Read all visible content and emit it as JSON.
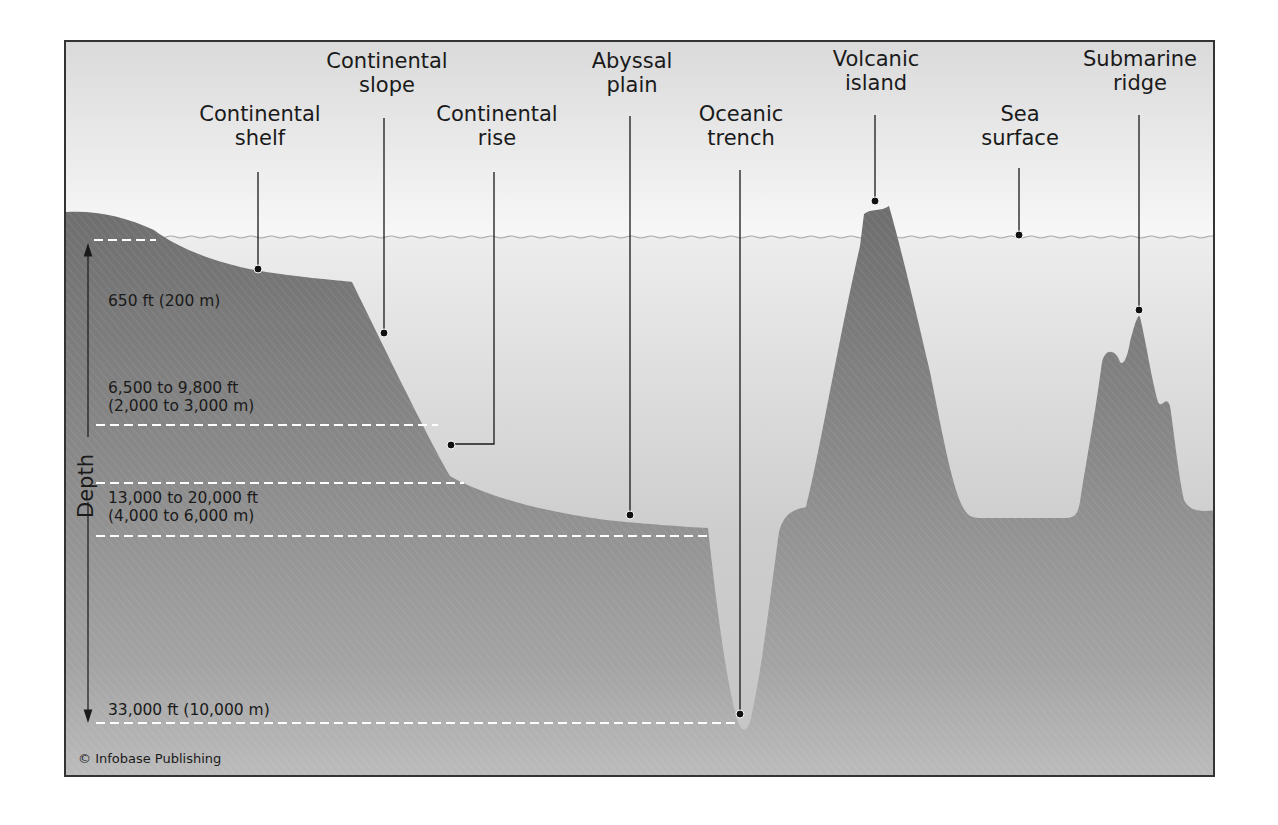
{
  "diagram": {
    "type": "ocean-floor-profile",
    "colors": {
      "sky_top": "#d9d9d9",
      "sky_bottom": "#f7f7f7",
      "water_top": "#ececec",
      "water_bottom": "#bcbcbc",
      "land": "#7a7a7a",
      "land_deep": "#999999",
      "frame": "#333333",
      "leader": "#1a1a1a",
      "dashed_line": "#ffffff"
    },
    "features": [
      {
        "id": "continental-shelf",
        "line1": "Continental",
        "line2": "shelf"
      },
      {
        "id": "continental-slope",
        "line1": "Continental",
        "line2": "slope"
      },
      {
        "id": "continental-rise",
        "line1": "Continental",
        "line2": "rise"
      },
      {
        "id": "abyssal-plain",
        "line1": "Abyssal",
        "line2": "plain"
      },
      {
        "id": "oceanic-trench",
        "line1": "Oceanic",
        "line2": "trench"
      },
      {
        "id": "volcanic-island",
        "line1": "Volcanic",
        "line2": "island"
      },
      {
        "id": "sea-surface",
        "line1": "Sea",
        "line2": "surface"
      },
      {
        "id": "submarine-ridge",
        "line1": "Submarine",
        "line2": "ridge"
      }
    ],
    "depth_axis": {
      "label": "Depth",
      "markers": [
        {
          "line1": "650 ft (200 m)",
          "line2": ""
        },
        {
          "line1": "6,500 to 9,800 ft",
          "line2": "(2,000 to 3,000 m)"
        },
        {
          "line1": "13,000 to 20,000 ft",
          "line2": "(4,000 to 6,000 m)"
        },
        {
          "line1": "33,000 ft (10,000 m)",
          "line2": ""
        }
      ]
    },
    "credit": "© Infobase Publishing"
  }
}
